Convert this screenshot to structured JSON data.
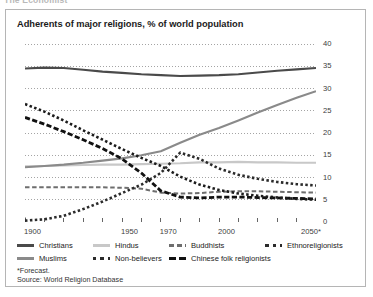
{
  "page": {
    "cutoff_header": "The Economist"
  },
  "chart_title": "Adherents of major religions, % of world population",
  "footnotes": {
    "forecast": "*Forecast.",
    "source": "Source: World Religion Database"
  },
  "axes": {
    "y_ticks": [
      "0",
      "5",
      "10",
      "15",
      "20",
      "25",
      "30",
      "35",
      "40"
    ],
    "x_ticks": [
      "1900",
      "1950",
      "1970",
      "2000",
      "2050*"
    ],
    "x_tick_values": [
      1900,
      1950,
      1970,
      2000,
      2050
    ]
  },
  "colors": {
    "christians": "#4a4a4a",
    "hindus": "#c8c8c8",
    "buddhists": "#6e6e6e",
    "ethnoreligionists": "#1c1c1c",
    "muslims": "#8a8a8a",
    "nonbelievers": "#2b2b2b",
    "chinese_folk": "#111111",
    "grid": "#9a9a9a",
    "axis": "#555555",
    "panel_border": "#b5b5b5"
  },
  "legend": [
    {
      "label": "Christians",
      "key": "solid-dark"
    },
    {
      "label": "Hindus",
      "key": "solid-light"
    },
    {
      "label": "Buddhists",
      "key": "dash-medium"
    },
    {
      "label": "Ethnoreligionists",
      "key": "dot-dark"
    },
    {
      "label": "Muslims",
      "key": "solid-medium"
    },
    {
      "label": "Non-believers",
      "key": "dot-dark"
    },
    {
      "label": "Chinese folk religionists",
      "key": "dash-bold"
    }
  ],
  "chart_data": {
    "type": "line",
    "title": "Adherents of major religions, % of world population",
    "xlabel": "",
    "ylabel": "% of world population",
    "xlim": [
      1900,
      2050
    ],
    "ylim": [
      0,
      40
    ],
    "ytick_step": 5,
    "grid": "horizontal-dotted",
    "legend_position": "below",
    "annotations": [
      "*Forecast.",
      "Source: World Religion Database"
    ],
    "x": [
      1900,
      1910,
      1920,
      1930,
      1940,
      1950,
      1960,
      1970,
      1980,
      1990,
      2000,
      2010,
      2020,
      2030,
      2040,
      2050
    ],
    "series": [
      {
        "name": "Christians",
        "style": "solid",
        "color": "#4a4a4a",
        "values": [
          34.5,
          34.7,
          34.6,
          34.2,
          33.8,
          33.5,
          33.2,
          33.0,
          32.8,
          32.9,
          33.0,
          33.2,
          33.6,
          34.0,
          34.3,
          34.6
        ]
      },
      {
        "name": "Hindus",
        "style": "solid",
        "color": "#c8c8c8",
        "values": [
          12.5,
          12.6,
          12.7,
          12.8,
          12.9,
          12.9,
          13.0,
          13.1,
          13.2,
          13.4,
          13.4,
          13.5,
          13.4,
          13.4,
          13.3,
          13.3
        ]
      },
      {
        "name": "Buddhists",
        "style": "dashed",
        "color": "#6e6e6e",
        "values": [
          7.8,
          7.8,
          7.8,
          7.8,
          7.8,
          7.7,
          7.5,
          6.6,
          6.4,
          6.5,
          6.8,
          6.9,
          6.9,
          6.8,
          6.7,
          6.6
        ]
      },
      {
        "name": "Ethnoreligionists",
        "style": "dotted",
        "color": "#1c1c1c",
        "values": [
          26.5,
          24.8,
          22.8,
          20.6,
          18.5,
          16.4,
          14.4,
          12.6,
          10.2,
          8.4,
          7.2,
          6.4,
          5.9,
          5.5,
          5.2,
          5.0
        ]
      },
      {
        "name": "Muslims",
        "style": "solid",
        "color": "#8a8a8a",
        "values": [
          12.3,
          12.6,
          12.9,
          13.3,
          13.8,
          14.3,
          15.0,
          15.9,
          17.8,
          19.6,
          21.1,
          22.8,
          24.6,
          26.3,
          27.9,
          29.4
        ]
      },
      {
        "name": "Non-believers",
        "style": "dotted",
        "color": "#2b2b2b",
        "values": [
          0.3,
          0.6,
          1.4,
          2.9,
          4.6,
          6.5,
          8.4,
          11.0,
          15.6,
          14.2,
          12.0,
          10.6,
          9.7,
          9.0,
          8.5,
          8.2
        ]
      },
      {
        "name": "Chinese folk religionists",
        "style": "dashed-bold",
        "color": "#111111",
        "values": [
          23.5,
          22.0,
          20.3,
          18.5,
          16.5,
          14.2,
          11.0,
          7.0,
          5.6,
          5.4,
          5.6,
          5.6,
          5.5,
          5.4,
          5.3,
          5.2
        ]
      }
    ]
  }
}
